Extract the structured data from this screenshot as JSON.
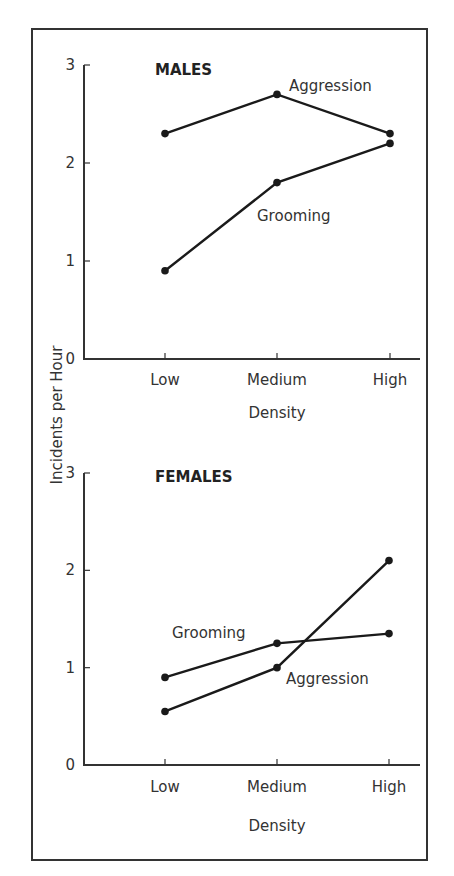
{
  "chart_data": [
    {
      "type": "line",
      "title": "MALES",
      "xlabel": "Density",
      "ylabel": "Incidents per Hour",
      "categories": [
        "Low",
        "Medium",
        "High"
      ],
      "ylim": [
        0,
        3
      ],
      "yticks": [
        "0",
        "1",
        "2",
        "3"
      ],
      "grid": false,
      "series": [
        {
          "name": "Aggression",
          "values": [
            2.3,
            2.7,
            2.3
          ]
        },
        {
          "name": "Grooming",
          "values": [
            0.9,
            1.8,
            2.2
          ]
        }
      ]
    },
    {
      "type": "line",
      "title": "FEMALES",
      "xlabel": "Density",
      "ylabel": "Incidents per Hour",
      "categories": [
        "Low",
        "Medium",
        "High"
      ],
      "ylim": [
        0,
        3
      ],
      "yticks": [
        "0",
        "1",
        "2",
        "3"
      ],
      "grid": false,
      "series": [
        {
          "name": "Grooming",
          "values": [
            0.9,
            1.25,
            1.35
          ]
        },
        {
          "name": "Aggression",
          "values": [
            0.55,
            1.0,
            2.1
          ]
        }
      ]
    }
  ],
  "shared": {
    "ylabel": "Incidents per Hour"
  },
  "layout": {
    "panels": [
      {
        "x0": 84,
        "xEnd": 420,
        "y0": 359,
        "y3": 65,
        "xPositions": [
          165,
          277,
          390
        ],
        "titlePos": [
          155,
          75
        ],
        "xTickLabelY": 385,
        "xLabelY": 418,
        "seriesLabelPos": [
          [
            289,
            91
          ],
          [
            257,
            221
          ]
        ]
      },
      {
        "x0": 84,
        "xEnd": 420,
        "y0": 765,
        "y3": 473,
        "xPositions": [
          165,
          277,
          389
        ],
        "titlePos": [
          155,
          482
        ],
        "xTickLabelY": 792,
        "xLabelY": 831,
        "seriesLabelPos": [
          [
            172,
            638
          ],
          [
            286,
            684
          ]
        ]
      }
    ],
    "ylabelPos": [
      57,
      415
    ]
  }
}
